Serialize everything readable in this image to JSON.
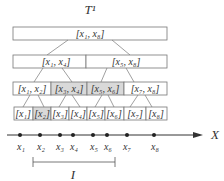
{
  "title": "T¹",
  "tree": {
    "level0": [
      {
        "label": "[x₁, x₈]",
        "shaded": false
      }
    ],
    "level1": [
      {
        "label": "[x₁, x₄]",
        "shaded": false
      },
      {
        "label": "[x₅, x₈]",
        "shaded": false
      }
    ],
    "level2": [
      {
        "label": "[x₁, x₂]",
        "shaded": false
      },
      {
        "label": "[x₃, x₄]",
        "shaded": true
      },
      {
        "label": "[x₅, x₆]",
        "shaded": true
      },
      {
        "label": "[x₇, x₈]",
        "shaded": false
      }
    ],
    "level3": [
      {
        "label": "[x₁]",
        "shaded": false
      },
      {
        "label": "[x₂]",
        "shaded": true
      },
      {
        "label": "[x₃]",
        "shaded": false
      },
      {
        "label": "[x₄]",
        "shaded": false
      },
      {
        "label": "[x₅]",
        "shaded": false
      },
      {
        "label": "[x₆]",
        "shaded": false
      },
      {
        "label": "[x₇]",
        "shaded": false
      },
      {
        "label": "[x₈]",
        "shaded": false
      }
    ]
  },
  "axis": {
    "label": "X",
    "points": [
      "x₁",
      "x₂",
      "x₃",
      "x₄",
      "x₅",
      "x₆",
      "x₇",
      "x₈"
    ]
  },
  "interval": {
    "label": "I"
  }
}
